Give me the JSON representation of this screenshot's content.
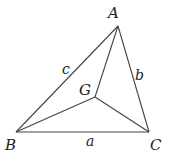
{
  "diagram": {
    "type": "triangle-with-interior-point",
    "vertices": {
      "A": {
        "label": "A",
        "x": 118,
        "y": 26
      },
      "B": {
        "label": "B",
        "x": 16,
        "y": 132
      },
      "C": {
        "label": "C",
        "x": 149,
        "y": 132
      },
      "G": {
        "label": "G",
        "x": 95,
        "y": 97
      }
    },
    "sides": {
      "a": {
        "label": "a",
        "from": "B",
        "to": "C"
      },
      "b": {
        "label": "b",
        "from": "A",
        "to": "C"
      },
      "c": {
        "label": "c",
        "from": "A",
        "to": "B"
      }
    },
    "segments_to_G": [
      "A",
      "B",
      "C"
    ]
  }
}
